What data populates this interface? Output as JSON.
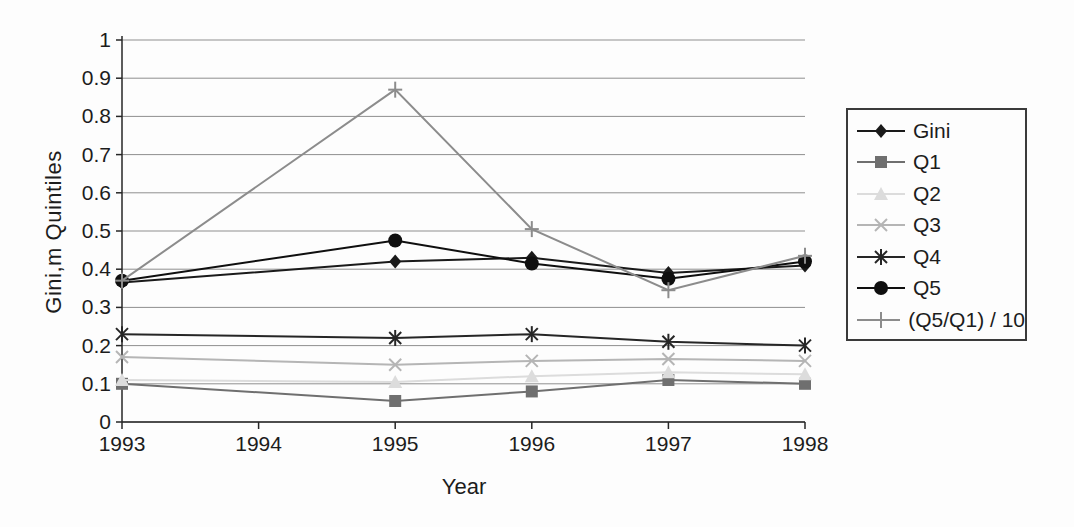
{
  "chart_data": {
    "type": "line",
    "title": "",
    "xlabel": "Year",
    "ylabel": "Gini,m Quintiles",
    "x": [
      1993,
      1995,
      1996,
      1997,
      1998
    ],
    "x_ticks": [
      "1993",
      "1994",
      "1995",
      "1996",
      "1997",
      "1998"
    ],
    "x_range": [
      1993,
      1998
    ],
    "ylim": [
      0,
      1
    ],
    "y_tick_step": 0.1,
    "y_tick_labels": [
      "0",
      "0.1",
      "0.2",
      "0.3",
      "0.4",
      "0.5",
      "0.6",
      "0.7",
      "0.8",
      "0.9",
      "1"
    ],
    "grid": "horizontal",
    "legend_position": "right-outside",
    "series": [
      {
        "name": "Gini",
        "marker": "diamond",
        "color": "#1a1a1a",
        "values": [
          0.365,
          0.42,
          0.43,
          0.39,
          0.41
        ]
      },
      {
        "name": "Q1",
        "marker": "square",
        "color": "#6f6f6f",
        "values": [
          0.1,
          0.055,
          0.08,
          0.11,
          0.1
        ]
      },
      {
        "name": "Q2",
        "marker": "triangle",
        "color": "#dcdcdc",
        "values": [
          0.11,
          0.105,
          0.12,
          0.13,
          0.125
        ]
      },
      {
        "name": "Q3",
        "marker": "x",
        "color": "#b5b5b5",
        "values": [
          0.17,
          0.15,
          0.16,
          0.165,
          0.16
        ]
      },
      {
        "name": "Q4",
        "marker": "asterisk",
        "color": "#262626",
        "values": [
          0.23,
          0.22,
          0.23,
          0.21,
          0.2
        ]
      },
      {
        "name": "Q5",
        "marker": "circle",
        "color": "#0f0f0f",
        "values": [
          0.37,
          0.475,
          0.415,
          0.375,
          0.42
        ]
      },
      {
        "name": "(Q5/Q1) / 10",
        "marker": "plus",
        "color": "#8c8c8c",
        "values": [
          0.37,
          0.87,
          0.505,
          0.345,
          0.435
        ]
      }
    ],
    "axis_color": "#262626",
    "gridline_color": "#8f8f8f"
  }
}
